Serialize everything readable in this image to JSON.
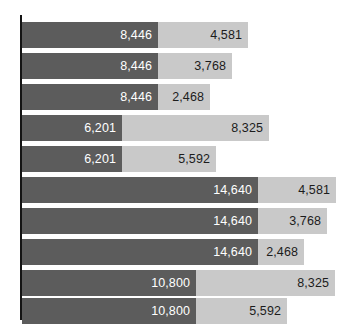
{
  "chart_data": {
    "type": "bar",
    "orientation": "horizontal",
    "stacked": true,
    "title": "",
    "subtitle": "",
    "xlabel": "",
    "ylabel": "",
    "grid": false,
    "legend": "none",
    "axis_tick_labels": [],
    "category_tick_labels": [],
    "xlim": [
      0,
      20500
    ],
    "categories": [
      "1",
      "2",
      "3",
      "4",
      "5",
      "6",
      "7",
      "8",
      "9",
      "10"
    ],
    "series": [
      {
        "name": "base",
        "color": "#5c5c5c",
        "values": [
          8446,
          8446,
          8446,
          6201,
          6201,
          14640,
          14640,
          14640,
          10800,
          10800
        ],
        "labels": [
          "8,446",
          "8,446",
          "8,446",
          "6,201",
          "6,201",
          "14,640",
          "14,640",
          "14,640",
          "10,800",
          "10,800"
        ]
      },
      {
        "name": "extension",
        "color": "#c9c9c9",
        "values": [
          4581,
          3768,
          2468,
          8325,
          5592,
          4581,
          3768,
          2468,
          8325,
          5592
        ],
        "labels": [
          "4,581",
          "3,768",
          "2,468",
          "8,325",
          "5,592",
          "4,581",
          "3,768",
          "2,468",
          "8,325",
          "5,592"
        ]
      }
    ],
    "totals": [
      13027,
      12214,
      10914,
      14526,
      11793,
      19221,
      18408,
      17108,
      19125,
      16392
    ]
  },
  "rows": [
    {
      "top": 22,
      "base_label": "8,446",
      "ext_label": "4,581",
      "base_w": 136,
      "ext_w": 90
    },
    {
      "top": 53,
      "base_label": "8,446",
      "ext_label": "3,768",
      "base_w": 136,
      "ext_w": 74
    },
    {
      "top": 84,
      "base_label": "8,446",
      "ext_label": "2,468",
      "base_w": 136,
      "ext_w": 52
    },
    {
      "top": 115,
      "base_label": "6,201",
      "ext_label": "8,325",
      "base_w": 100,
      "ext_w": 147
    },
    {
      "top": 146,
      "base_label": "6,201",
      "ext_label": "5,592",
      "base_w": 100,
      "ext_w": 94
    },
    {
      "top": 177,
      "base_label": "14,640",
      "ext_label": "4,581",
      "base_w": 236,
      "ext_w": 78
    },
    {
      "top": 208,
      "base_label": "14,640",
      "ext_label": "3,768",
      "base_w": 236,
      "ext_w": 69
    },
    {
      "top": 239,
      "base_label": "14,640",
      "ext_label": "2,468",
      "base_w": 236,
      "ext_w": 46
    },
    {
      "top": 270,
      "base_label": "10,800",
      "ext_label": "8,325",
      "base_w": 174,
      "ext_w": 139
    },
    {
      "top": 298,
      "base_label": "10,800",
      "ext_label": "5,592",
      "base_w": 174,
      "ext_w": 91
    }
  ],
  "colors": {
    "base": "#5c5c5c",
    "extension": "#c9c9c9",
    "axis": "#141414",
    "background": "#ffffff",
    "base_label_text": "#ffffff",
    "extension_label_text": "#1c1c1c"
  }
}
